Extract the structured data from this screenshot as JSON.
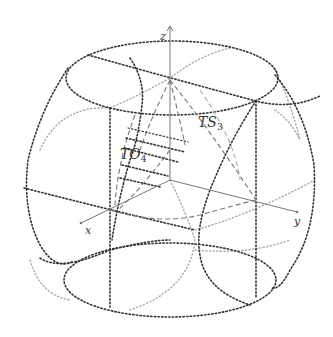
{
  "figure": {
    "axes": {
      "x_label": "x",
      "y_label": "y",
      "z_label": "z"
    },
    "region_labels": {
      "ts": {
        "base": "TS",
        "sub": "3"
      },
      "to": {
        "base": "TO",
        "sub": "4"
      }
    },
    "colors": {
      "dark_dotted": "#333333",
      "light_dotted": "#aaaaaa",
      "dashed": "#777777",
      "axis": "#777777",
      "background": "#ffffff"
    }
  }
}
